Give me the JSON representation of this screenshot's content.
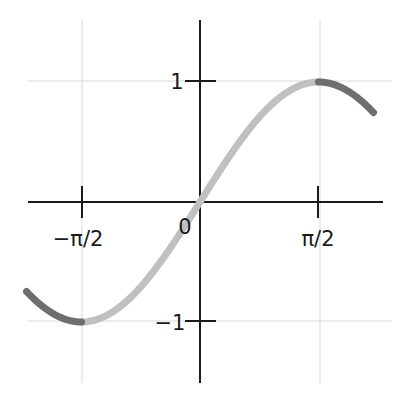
{
  "chart_data": {
    "type": "line",
    "title": "",
    "xlabel": "",
    "ylabel": "",
    "function": "sin(x)",
    "xlim": [
      -2.3,
      2.3
    ],
    "ylim": [
      -1.5,
      1.5
    ],
    "grid": true,
    "x_ticks": [
      {
        "value": -1.5708,
        "label": "−π/2"
      },
      {
        "value": 1.5708,
        "label": "π/2"
      }
    ],
    "y_ticks": [
      {
        "value": 1,
        "label": "1"
      },
      {
        "value": -1,
        "label": "−1"
      }
    ],
    "origin_label": "0",
    "series": [
      {
        "name": "sin(x) main segment",
        "x_range": [
          -1.5708,
          1.5708
        ],
        "color": "#c0c0c0"
      },
      {
        "name": "sin(x) left tail",
        "x_range": [
          -2.3,
          -1.5708
        ],
        "color": "#6e6e6e"
      },
      {
        "name": "sin(x) right tail",
        "x_range": [
          1.5708,
          2.3
        ],
        "color": "#6e6e6e"
      }
    ]
  },
  "colors": {
    "axis": "#1a1a1a",
    "grid": "#d8d8d8",
    "curve_light": "#c0c0c0",
    "curve_dark": "#6e6e6e"
  }
}
